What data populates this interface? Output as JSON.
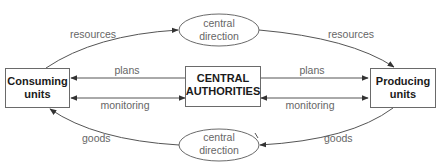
{
  "diagram": {
    "type": "flow-diagram",
    "nodes": {
      "consuming": {
        "line1": "Consuming",
        "line2": "units"
      },
      "central": {
        "line1": "CENTRAL",
        "line2": "AUTHORITIES"
      },
      "producing": {
        "line1": "Producing",
        "line2": "units"
      },
      "direction_top": {
        "line1": "central",
        "line2": "direction"
      },
      "direction_bottom": {
        "line1": "central",
        "line2": "direction"
      }
    },
    "edges": {
      "resources_left": "resources",
      "resources_right": "resources",
      "plans_left": "plans",
      "plans_right": "plans",
      "monitoring_left": "monitoring",
      "monitoring_right": "monitoring",
      "goods_left": "goods",
      "goods_right": "goods"
    },
    "colors": {
      "stroke": "#555555",
      "label": "#666666",
      "box_text": "#1a1a1a"
    }
  }
}
